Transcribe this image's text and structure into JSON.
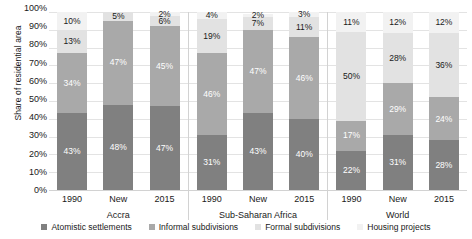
{
  "chart_data": {
    "type": "bar",
    "subtype": "stacked-bar-100-percent-grouped",
    "title": "",
    "subtitle": "",
    "xlabel": "",
    "ylabel": "Share of residential area",
    "ylim": [
      0,
      100
    ],
    "yticks": [
      "0%",
      "10%",
      "20%",
      "30%",
      "40%",
      "50%",
      "60%",
      "70%",
      "80%",
      "90%",
      "100%"
    ],
    "ytick_values": [
      0,
      10,
      20,
      30,
      40,
      50,
      60,
      70,
      80,
      90,
      100
    ],
    "grid": true,
    "legend_position": "bottom",
    "legend": [
      "Atomistic settlements",
      "Informal subdivisions",
      "Formal subdivisions",
      "Housing projects"
    ],
    "series_colors": [
      "#808080",
      "#a9a9a9",
      "#e2e2e2",
      "#f2f2f2"
    ],
    "groups": [
      {
        "name": "Accra",
        "categories": [
          "1990",
          "New",
          "2015"
        ],
        "bars": [
          {
            "category": "1990",
            "segments": [
              {
                "series": "Atomistic settlements",
                "value": 43,
                "label": "43%"
              },
              {
                "series": "Informal subdivisions",
                "value": 34,
                "label": "34%"
              },
              {
                "series": "Formal subdivisions",
                "value": 13,
                "label": "13%"
              },
              {
                "series": "Housing projects",
                "value": 10,
                "label": "10%"
              }
            ]
          },
          {
            "category": "New",
            "segments": [
              {
                "series": "Atomistic settlements",
                "value": 48,
                "label": "48%"
              },
              {
                "series": "Informal subdivisions",
                "value": 47,
                "label": "47%"
              },
              {
                "series": "Formal subdivisions",
                "value": 5,
                "label": "5%"
              },
              {
                "series": "Housing projects",
                "value": 0,
                "label": ""
              }
            ]
          },
          {
            "category": "2015",
            "segments": [
              {
                "series": "Atomistic settlements",
                "value": 47,
                "label": "47%"
              },
              {
                "series": "Informal subdivisions",
                "value": 45,
                "label": "45%"
              },
              {
                "series": "Formal subdivisions",
                "value": 6,
                "label": "6%"
              },
              {
                "series": "Housing projects",
                "value": 2,
                "label": "2%"
              }
            ]
          }
        ]
      },
      {
        "name": "Sub-Saharan Africa",
        "categories": [
          "1990",
          "New",
          "2015"
        ],
        "bars": [
          {
            "category": "1990",
            "segments": [
              {
                "series": "Atomistic settlements",
                "value": 31,
                "label": "31%"
              },
              {
                "series": "Informal subdivisions",
                "value": 46,
                "label": "46%"
              },
              {
                "series": "Formal subdivisions",
                "value": 19,
                "label": "19%"
              },
              {
                "series": "Housing projects",
                "value": 4,
                "label": "4%"
              }
            ]
          },
          {
            "category": "New",
            "segments": [
              {
                "series": "Atomistic settlements",
                "value": 43,
                "label": "43%"
              },
              {
                "series": "Informal subdivisions",
                "value": 47,
                "label": "47%"
              },
              {
                "series": "Formal subdivisions",
                "value": 7,
                "label": "7%"
              },
              {
                "series": "Housing projects",
                "value": 2,
                "label": "2%"
              }
            ]
          },
          {
            "category": "2015",
            "segments": [
              {
                "series": "Atomistic settlements",
                "value": 40,
                "label": "40%"
              },
              {
                "series": "Informal subdivisions",
                "value": 46,
                "label": "46%"
              },
              {
                "series": "Formal subdivisions",
                "value": 11,
                "label": "11%"
              },
              {
                "series": "Housing projects",
                "value": 3,
                "label": "3%"
              }
            ]
          }
        ]
      },
      {
        "name": "World",
        "categories": [
          "1990",
          "New",
          "2015"
        ],
        "bars": [
          {
            "category": "1990",
            "segments": [
              {
                "series": "Atomistic settlements",
                "value": 22,
                "label": "22%"
              },
              {
                "series": "Informal subdivisions",
                "value": 17,
                "label": "17%"
              },
              {
                "series": "Formal subdivisions",
                "value": 50,
                "label": "50%"
              },
              {
                "series": "Housing projects",
                "value": 11,
                "label": "11%"
              }
            ]
          },
          {
            "category": "New",
            "segments": [
              {
                "series": "Atomistic settlements",
                "value": 31,
                "label": "31%"
              },
              {
                "series": "Informal subdivisions",
                "value": 29,
                "label": "29%"
              },
              {
                "series": "Formal subdivisions",
                "value": 28,
                "label": "28%"
              },
              {
                "series": "Housing projects",
                "value": 12,
                "label": "12%"
              }
            ]
          },
          {
            "category": "2015",
            "segments": [
              {
                "series": "Atomistic settlements",
                "value": 28,
                "label": "28%"
              },
              {
                "series": "Informal subdivisions",
                "value": 24,
                "label": "24%"
              },
              {
                "series": "Formal subdivisions",
                "value": 36,
                "label": "36%"
              },
              {
                "series": "Housing projects",
                "value": 12,
                "label": "12%"
              }
            ]
          }
        ]
      }
    ]
  }
}
